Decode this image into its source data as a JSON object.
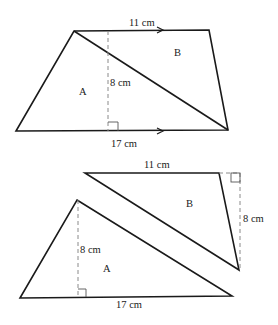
{
  "figure_top": {
    "description": "Trapezium divided by a diagonal into triangles A and B",
    "labels": {
      "top_side": "11 cm",
      "bottom_side": "17 cm",
      "height": "8 cm",
      "region_a": "A",
      "region_b": "B"
    }
  },
  "figure_bottom": {
    "description": "Triangles A and B separated",
    "triangle_b": {
      "top_side": "11 cm",
      "height": "8 cm",
      "label": "B"
    },
    "triangle_a": {
      "base": "17 cm",
      "height": "8 cm",
      "label": "A"
    }
  },
  "colors": {
    "stroke": "#1a1a1a",
    "dashed": "#8a8a8a",
    "background": "#ffffff"
  }
}
